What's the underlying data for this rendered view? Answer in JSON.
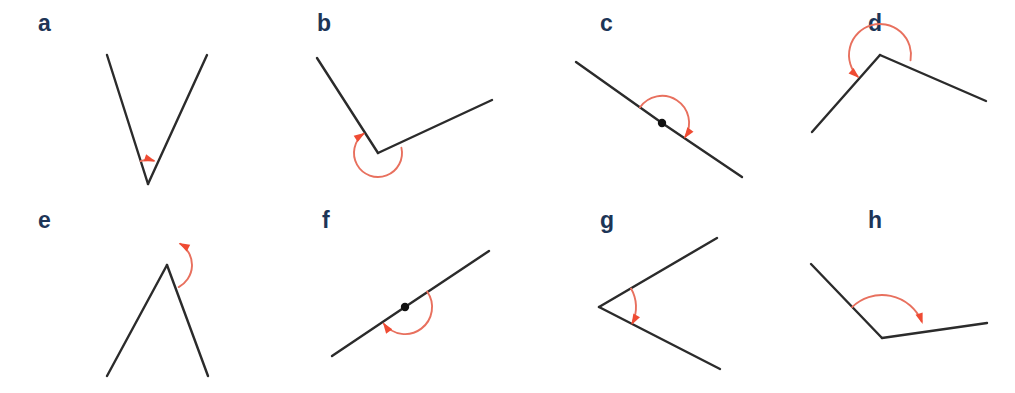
{
  "figure": {
    "background_color": "#ffffff",
    "width": 1015,
    "height": 393,
    "colors": {
      "label": "#1d3557",
      "ray": "#2b2b2b",
      "arc": "#e8705e",
      "arrowhead": "#ef4b33",
      "vertex_dot": "#111111"
    },
    "rows": 2,
    "columns": 4
  },
  "panels": [
    {
      "id": "a",
      "label": "a",
      "label_pos": {
        "x": 38,
        "y": 31
      },
      "angle_type": "acute",
      "vertex": {
        "x": 148,
        "y": 184
      },
      "rays": [
        {
          "name": "ray-left",
          "x": 107,
          "y": 55
        },
        {
          "name": "ray-right",
          "x": 207,
          "y": 55
        }
      ],
      "vertex_dot": false,
      "arc": {
        "radius": 24,
        "start_deg": 252,
        "end_deg": 288,
        "sweep": "clockwise",
        "arrow_at": "end"
      }
    },
    {
      "id": "b",
      "label": "b",
      "label_pos": {
        "x": 317,
        "y": 31
      },
      "angle_type": "reflex",
      "vertex": {
        "x": 378,
        "y": 153
      },
      "rays": [
        {
          "name": "ray-upper-left",
          "x": 317,
          "y": 58
        },
        {
          "name": "ray-right",
          "x": 492,
          "y": 100
        }
      ],
      "vertex_dot": false,
      "arc": {
        "radius": 24,
        "start_deg": -13,
        "end_deg": 237,
        "sweep": "clockwise",
        "arrow_at": "end"
      }
    },
    {
      "id": "c",
      "label": "c",
      "label_pos": {
        "x": 600,
        "y": 31
      },
      "angle_type": "straight",
      "vertex": {
        "x": 662,
        "y": 123
      },
      "rays": [
        {
          "name": "ray-upper-left",
          "x": 576,
          "y": 62
        },
        {
          "name": "ray-lower-right",
          "x": 742,
          "y": 177
        }
      ],
      "vertex_dot": true,
      "arc": {
        "radius": 27,
        "start_deg": 215,
        "end_deg": 35,
        "sweep": "clockwise",
        "arrow_at": "end"
      }
    },
    {
      "id": "d",
      "label": "d",
      "label_pos": {
        "x": 868,
        "y": 31
      },
      "angle_type": "obtuse",
      "vertex": {
        "x": 880,
        "y": 55
      },
      "rays": [
        {
          "name": "ray-lower-left",
          "x": 812,
          "y": 132
        },
        {
          "name": "ray-lower-right",
          "x": 986,
          "y": 101
        }
      ],
      "vertex_dot": false,
      "arc": {
        "radius": 31,
        "start_deg": 10,
        "end_deg": 132,
        "sweep": "counterclockwise",
        "arrow_at": "end"
      }
    },
    {
      "id": "e",
      "label": "e",
      "label_pos": {
        "x": 38,
        "y": 228
      },
      "angle_type": "reflex",
      "vertex": {
        "x": 167,
        "y": 265
      },
      "rays": [
        {
          "name": "ray-lower-left",
          "x": 107,
          "y": 376
        },
        {
          "name": "ray-lower-right",
          "x": 208,
          "y": 376
        }
      ],
      "vertex_dot": false,
      "arc": {
        "radius": 25,
        "start_deg": 62,
        "end_deg": 298,
        "sweep": "counterclockwise",
        "arrow_at": "end"
      }
    },
    {
      "id": "f",
      "label": "f",
      "label_pos": {
        "x": 322,
        "y": 228
      },
      "angle_type": "straight",
      "vertex": {
        "x": 405,
        "y": 307
      },
      "rays": [
        {
          "name": "ray-lower-left",
          "x": 332,
          "y": 356
        },
        {
          "name": "ray-upper-right",
          "x": 489,
          "y": 251
        }
      ],
      "vertex_dot": true,
      "arc": {
        "radius": 27,
        "start_deg": -35,
        "end_deg": 145,
        "sweep": "clockwise",
        "arrow_at": "end"
      }
    },
    {
      "id": "g",
      "label": "g",
      "label_pos": {
        "x": 600,
        "y": 228
      },
      "angle_type": "acute",
      "vertex": {
        "x": 599,
        "y": 307
      },
      "rays": [
        {
          "name": "ray-upper-right",
          "x": 717,
          "y": 238
        },
        {
          "name": "ray-lower-right",
          "x": 720,
          "y": 369
        }
      ],
      "vertex_dot": false,
      "arc": {
        "radius": 37,
        "start_deg": -30,
        "end_deg": 29,
        "sweep": "clockwise",
        "arrow_at": "end"
      }
    },
    {
      "id": "h",
      "label": "h",
      "label_pos": {
        "x": 868,
        "y": 228
      },
      "angle_type": "obtuse",
      "vertex": {
        "x": 882,
        "y": 338
      },
      "rays": [
        {
          "name": "ray-upper-left",
          "x": 811,
          "y": 264
        },
        {
          "name": "ray-right",
          "x": 987,
          "y": 323
        }
      ],
      "vertex_dot": false,
      "arc": {
        "radius": 43,
        "start_deg": 226,
        "end_deg": 341,
        "sweep": "clockwise",
        "arrow_at": "end"
      }
    }
  ]
}
